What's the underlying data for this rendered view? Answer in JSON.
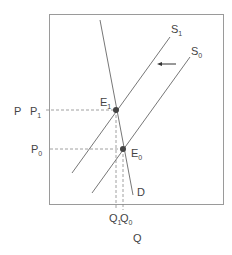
{
  "diagram": {
    "type": "supply-demand",
    "axis_labels": {
      "price": "P",
      "quantity": "Q"
    },
    "price_levels": [
      {
        "label": "P",
        "sub": "1"
      },
      {
        "label": "P",
        "sub": "0"
      }
    ],
    "quantity_levels": [
      {
        "label": "Q",
        "sub": "1"
      },
      {
        "label": "Q",
        "sub": "0"
      }
    ],
    "curves": {
      "supply_new": {
        "label": "S",
        "sub": "1"
      },
      "supply_old": {
        "label": "S",
        "sub": "0"
      },
      "demand": {
        "label": "D"
      }
    },
    "equilibria": [
      {
        "label": "E",
        "sub": "1"
      },
      {
        "label": "E",
        "sub": "0"
      }
    ],
    "shift_arrow": "leftward shift of supply",
    "colors": {
      "line": "#777777",
      "dot": "#444444",
      "dash": "#888888",
      "frame": "#999999"
    }
  }
}
